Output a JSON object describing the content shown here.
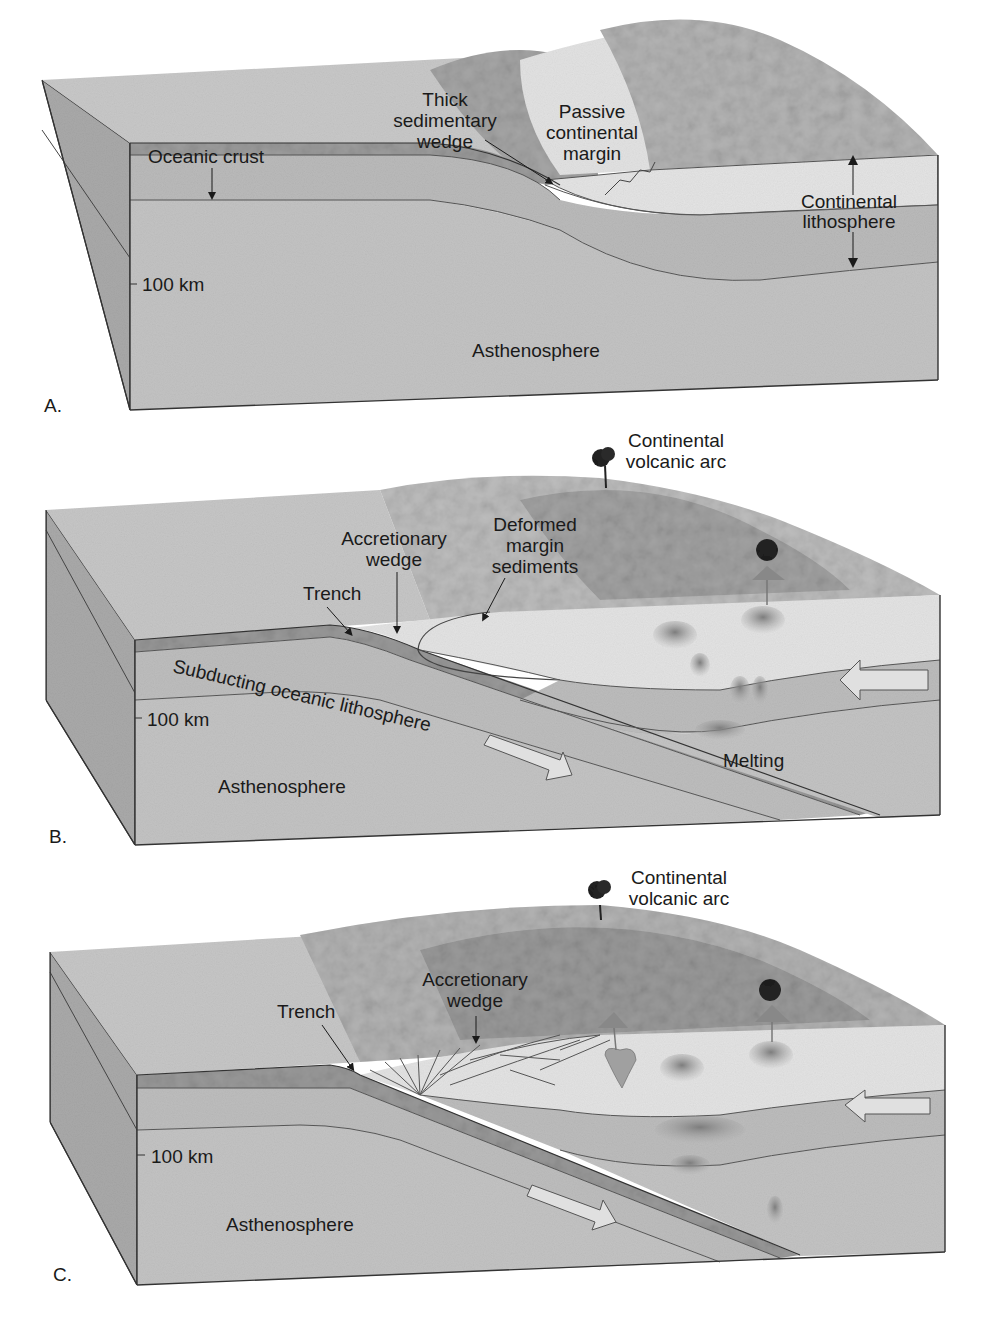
{
  "figure": {
    "panels": [
      {
        "letter": "A.",
        "stage": "passive-margin",
        "labels": {
          "oceanic_crust": "Oceanic crust",
          "sed_wedge_1": "Thick",
          "sed_wedge_2": "sedimentary",
          "sed_wedge_3": "wedge",
          "passive_1": "Passive",
          "passive_2": "continental",
          "passive_3": "margin",
          "cont_litho_1": "Continental",
          "cont_litho_2": "lithosphere",
          "depth": "100 km",
          "asthenosphere": "Asthenosphere"
        }
      },
      {
        "letter": "B.",
        "stage": "subduction-begins",
        "labels": {
          "arc_1": "Continental",
          "arc_2": "volcanic arc",
          "accretionary_1": "Accretionary",
          "accretionary_2": "wedge",
          "deformed_1": "Deformed",
          "deformed_2": "margin",
          "deformed_3": "sediments",
          "trench": "Trench",
          "subducting": "Subducting oceanic lithosphere",
          "depth": "100 km",
          "melting": "Melting",
          "asthenosphere": "Asthenosphere"
        }
      },
      {
        "letter": "C.",
        "stage": "mature-arc",
        "labels": {
          "arc_1": "Continental",
          "arc_2": "volcanic arc",
          "accretionary_1": "Accretionary",
          "accretionary_2": "wedge",
          "trench": "Trench",
          "depth": "100 km",
          "asthenosphere": "Asthenosphere"
        }
      }
    ],
    "colors": {
      "surface": "#c9c9c9",
      "ocean_floor": "#bdbdbd",
      "continent": "#e6e6e6",
      "mantle_lith": "#bcbcbc",
      "asthenosphere": "#c2c2c2",
      "side": "#a8a8a8",
      "line": "#333333",
      "magma": "#8f8f8f",
      "volcano_plume": "#2a2a2a"
    }
  }
}
